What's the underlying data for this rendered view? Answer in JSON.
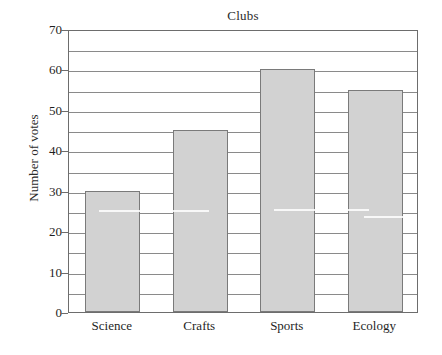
{
  "chart_data": {
    "type": "bar",
    "title": "Clubs",
    "xlabel": "",
    "ylabel": "Number of votes",
    "categories": [
      "Science",
      "Crafts",
      "Sports",
      "Ecology"
    ],
    "values": [
      30,
      45,
      60,
      55
    ],
    "ylim": [
      0,
      70
    ],
    "ytick_labels": [
      "0",
      "10",
      "20",
      "30",
      "40",
      "50",
      "60",
      "70"
    ],
    "ytick_values": [
      0,
      10,
      20,
      30,
      40,
      50,
      60,
      70
    ],
    "gridline_values": [
      5,
      10,
      15,
      20,
      25,
      30,
      35,
      40,
      45,
      50,
      55,
      60,
      65,
      70
    ],
    "grid": true,
    "minor_grid_step": 5,
    "legend": null,
    "legend_position": "none",
    "bar_fill_color": "#d2d2d2",
    "bar_edge_color": "#7a7a7a",
    "grid_color": "#8a8a8a",
    "axis_color": "#6d6d6d",
    "text_color": "#1f1f1f"
  }
}
